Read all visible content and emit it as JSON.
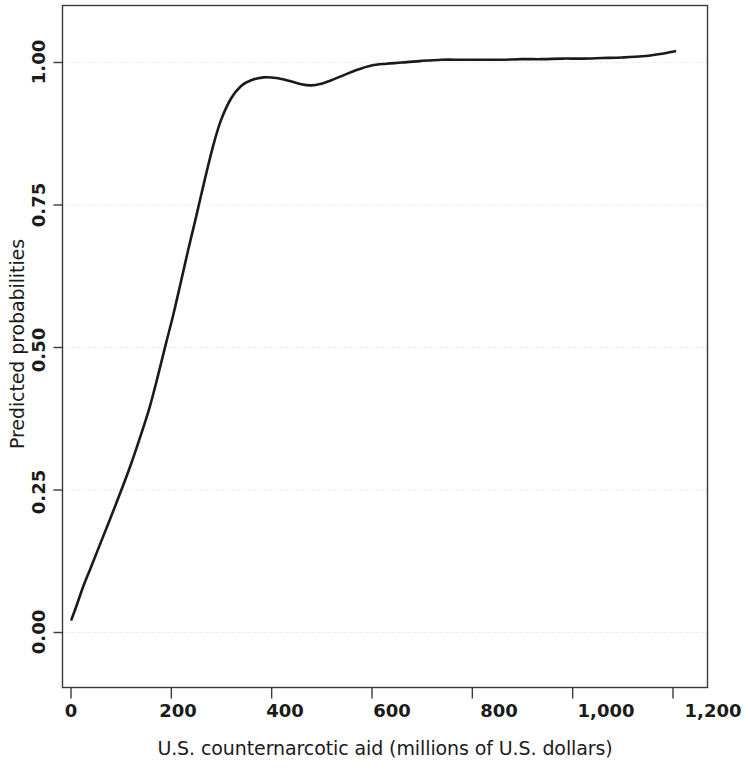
{
  "chart_data": {
    "type": "line",
    "title": "",
    "subtitle": "",
    "xlabel": "U.S. counternarcotic aid (millions of U.S. dollars)",
    "ylabel": "Predicted probabilities",
    "xlim": [
      -40,
      1255
    ],
    "ylim": [
      -0.12,
      1.12
    ],
    "xticks": [
      0,
      200,
      400,
      600,
      800,
      1000,
      1200
    ],
    "xticklabels": [
      "0",
      "200",
      "400",
      "600",
      "800",
      "1,000",
      "1,200"
    ],
    "yticks": [
      0.0,
      0.25,
      0.5,
      0.75,
      1.0
    ],
    "yticklabels": [
      "0.00",
      "0.25",
      "0.50",
      "0.75",
      "1.00"
    ],
    "grid": "horizontal-dotted",
    "grid_color": "#d9d9d9",
    "legend": "none",
    "line_color": "#1a1a1a",
    "line_width": 2.6,
    "frame": true,
    "frame_color": "#3b3b3b",
    "background": "#ffffff",
    "series": [
      {
        "name": "Predicted probability",
        "x": [
          2,
          12,
          25,
          40,
          58,
          78,
          100,
          120,
          140,
          158,
          175,
          190,
          205,
          220,
          235,
          250,
          268,
          285,
          300,
          320,
          340,
          360,
          385,
          410,
          435,
          460,
          480,
          500,
          520,
          545,
          570,
          600,
          630,
          660,
          700,
          740,
          780,
          820,
          860,
          900,
          940,
          980,
          1020,
          1060,
          1100,
          1140,
          1175,
          1205
        ],
        "y": [
          0.022,
          0.046,
          0.079,
          0.112,
          0.152,
          0.196,
          0.246,
          0.293,
          0.345,
          0.395,
          0.452,
          0.505,
          0.557,
          0.614,
          0.672,
          0.727,
          0.795,
          0.855,
          0.898,
          0.936,
          0.958,
          0.968,
          0.973,
          0.972,
          0.967,
          0.961,
          0.959,
          0.962,
          0.968,
          0.977,
          0.986,
          0.994,
          0.997,
          0.999,
          1.002,
          1.004,
          1.004,
          1.004,
          1.004,
          1.005,
          1.005,
          1.006,
          1.006,
          1.007,
          1.008,
          1.01,
          1.014,
          1.019
        ]
      }
    ]
  },
  "axes": {
    "y_tick_labels": [
      "1.00",
      "0.75",
      "0.50",
      "0.25",
      "0.00"
    ],
    "x_tick_labels": [
      "0",
      "200",
      "400",
      "600",
      "800",
      "1,000",
      "1,200"
    ]
  },
  "labels": {
    "y_axis_title": "Predicted probabilities",
    "x_axis_title": "U.S. counternarcotic aid (millions of U.S. dollars)"
  }
}
